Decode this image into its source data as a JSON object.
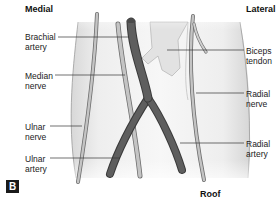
{
  "headers": {
    "medial": "Medial",
    "lateral": "Lateral",
    "roof": "Roof"
  },
  "panel_label": "B",
  "labels": {
    "brachial_artery": [
      "Brachial",
      "artery"
    ],
    "median_nerve": [
      "Median",
      "nerve"
    ],
    "ulnar_nerve": [
      "Ulnar",
      "nerve"
    ],
    "ulnar_artery": [
      "Ulnar",
      "artery"
    ],
    "biceps_tendon": [
      "Biceps",
      "tendon"
    ],
    "radial_nerve": [
      "Radial",
      "nerve"
    ],
    "radial_artery": [
      "Radial",
      "artery"
    ]
  },
  "colors": {
    "artery": "#555555",
    "artery_dark": "#3a3a3a",
    "nerve": "#bdbdbd",
    "nerve_outline": "#6e6e6e",
    "limb": "#ececec",
    "leader": "#333333"
  }
}
